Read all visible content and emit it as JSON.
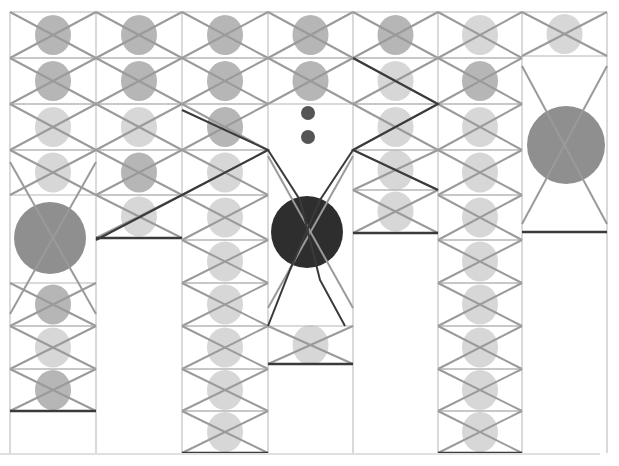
{
  "artwork": {
    "description": "Abstract drawing: grid of columns with crossed (X) cells, grey ink dots, a few large circles",
    "background": "#ffffff",
    "columns_x": [
      10,
      96,
      182,
      268,
      353,
      438,
      522,
      607
    ],
    "row_y": [
      12,
      58,
      104,
      150,
      195,
      240,
      283,
      326,
      369,
      411,
      453
    ],
    "colors": {
      "grid": "#b5b5b5",
      "cross_light": "#9a9a9a",
      "cross_dark": "#3a3a3a",
      "dot_light": "#d0d0d0",
      "dot_mid": "#a9a9a9",
      "dot_dark": "#2e2e2e",
      "big_grey": "#8f8f8f"
    },
    "columns": [
      {
        "x0": 10,
        "x1": 96,
        "cells": [
          [
            12,
            58,
            "mid"
          ],
          [
            58,
            104,
            "mid"
          ],
          [
            104,
            150,
            "light"
          ],
          [
            150,
            195,
            "light"
          ],
          [
            283,
            326,
            "mid"
          ],
          [
            326,
            369,
            "light"
          ],
          [
            369,
            411,
            "mid"
          ]
        ],
        "big": {
          "cx": 50,
          "cy": 238,
          "r": 36,
          "tone": "grey"
        },
        "base": 411
      },
      {
        "x0": 96,
        "x1": 182,
        "cells": [
          [
            12,
            58,
            "mid"
          ],
          [
            58,
            104,
            "mid"
          ],
          [
            104,
            150,
            "light"
          ],
          [
            150,
            195,
            "mid"
          ],
          [
            195,
            238,
            "light"
          ]
        ],
        "base": 238
      },
      {
        "x0": 182,
        "x1": 268,
        "cells": [
          [
            12,
            58,
            "mid"
          ],
          [
            58,
            104,
            "mid"
          ],
          [
            104,
            150,
            "mid"
          ],
          [
            150,
            195,
            "light"
          ],
          [
            195,
            240,
            "light"
          ],
          [
            240,
            283,
            "light"
          ],
          [
            283,
            326,
            "light"
          ],
          [
            326,
            369,
            "light"
          ],
          [
            369,
            411,
            "light"
          ],
          [
            411,
            453,
            "light"
          ]
        ],
        "base": 453
      },
      {
        "x0": 268,
        "x1": 353,
        "cells": [
          [
            12,
            58,
            "mid"
          ],
          [
            58,
            104,
            "mid"
          ],
          [
            326,
            364,
            "light"
          ]
        ],
        "small_dots": [
          [
            308,
            113
          ],
          [
            308,
            137
          ]
        ],
        "big": {
          "cx": 307,
          "cy": 232,
          "r": 36,
          "tone": "dark"
        },
        "base": 364
      },
      {
        "x0": 353,
        "x1": 438,
        "cells": [
          [
            12,
            58,
            "mid"
          ],
          [
            58,
            104,
            "light"
          ],
          [
            104,
            150,
            "light"
          ],
          [
            150,
            190,
            "light"
          ],
          [
            190,
            233,
            "light"
          ]
        ],
        "base": 233
      },
      {
        "x0": 438,
        "x1": 522,
        "cells": [
          [
            12,
            58,
            "light"
          ],
          [
            58,
            104,
            "mid"
          ],
          [
            104,
            150,
            "light"
          ],
          [
            150,
            195,
            "light"
          ],
          [
            195,
            240,
            "light"
          ],
          [
            240,
            283,
            "light"
          ],
          [
            283,
            326,
            "light"
          ],
          [
            326,
            369,
            "light"
          ],
          [
            369,
            411,
            "light"
          ],
          [
            411,
            453,
            "light"
          ]
        ],
        "base": 453
      },
      {
        "x0": 522,
        "x1": 607,
        "cells": [
          [
            12,
            56,
            "light"
          ]
        ],
        "big": {
          "cx": 566,
          "cy": 145,
          "r": 39,
          "tone": "grey"
        },
        "base": 232
      }
    ]
  }
}
